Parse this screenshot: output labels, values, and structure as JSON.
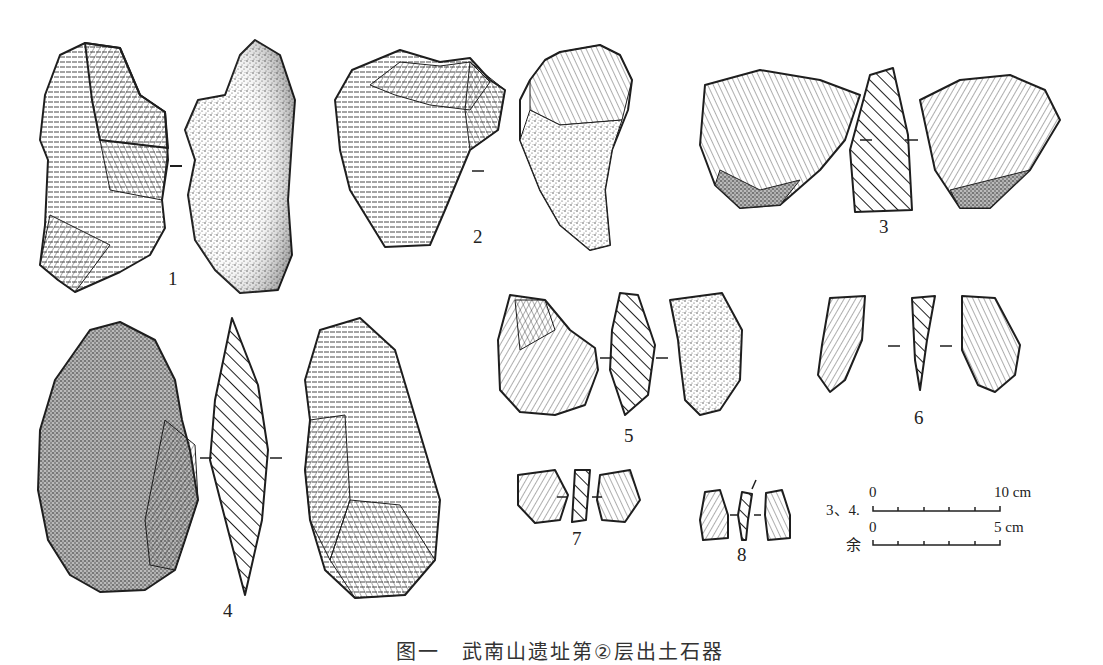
{
  "figure": {
    "artifacts": [
      {
        "id": "1",
        "label": "1",
        "views": [
          "dorsal",
          "ventral"
        ]
      },
      {
        "id": "2",
        "label": "2",
        "views": [
          "dorsal",
          "ventral"
        ]
      },
      {
        "id": "3",
        "label": "3",
        "views": [
          "dorsal",
          "section",
          "ventral"
        ]
      },
      {
        "id": "4",
        "label": "4",
        "views": [
          "ventral",
          "section",
          "dorsal"
        ]
      },
      {
        "id": "5",
        "label": "5",
        "views": [
          "dorsal",
          "section",
          "ventral"
        ]
      },
      {
        "id": "6",
        "label": "6",
        "views": [
          "dorsal",
          "section",
          "ventral"
        ]
      },
      {
        "id": "7",
        "label": "7",
        "views": [
          "dorsal",
          "section",
          "ventral"
        ]
      },
      {
        "id": "8",
        "label": "8",
        "views": [
          "dorsal",
          "section",
          "ventral"
        ]
      }
    ],
    "scale_bars": [
      {
        "prefix": "3、4.",
        "start": "0",
        "end": "10 cm"
      },
      {
        "prefix": "余",
        "start": "0",
        "end": "5 cm"
      }
    ],
    "caption": "图一　武南山遗址第②层出土石器"
  },
  "colors": {
    "ink": "#1e1e1e",
    "paper": "#ffffff"
  }
}
